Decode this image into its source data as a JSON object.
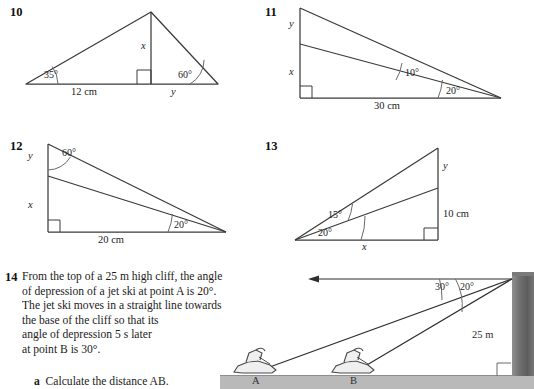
{
  "questions": [
    {
      "number": "10",
      "figure": {
        "base_label": "12 cm",
        "segment_label": "y",
        "height_label": "x",
        "angle_left": "35°",
        "angle_right": "60°",
        "right_angle": true
      }
    },
    {
      "number": "11",
      "figure": {
        "base_label": "30 cm",
        "upper_label": "y",
        "lower_label": "x",
        "angle_inner": "10°",
        "angle_outer": "20°",
        "right_angle": true
      }
    },
    {
      "number": "12",
      "figure": {
        "base_label": "20 cm",
        "upper_label": "y",
        "lower_label": "x",
        "angle_top": "60°",
        "angle_right": "20°",
        "right_angle": true
      }
    },
    {
      "number": "13",
      "figure": {
        "base_label": "x",
        "upper_label": "y",
        "lower_label": "10 cm",
        "angle_inner": "15°",
        "angle_outer": "20°",
        "right_angle": true
      }
    },
    {
      "number": "14",
      "body_lines": [
        "From the top of a 25 m high cliff, the angle",
        "of depression of a jet ski at point A is 20°.",
        "The jet ski moves in a straight line towards",
        "the base of the cliff so that its",
        "angle of depression 5 s later",
        "at point B is 30°."
      ],
      "parts": [
        {
          "letter": "a",
          "text": "Calculate the distance AB."
        }
      ],
      "figure": {
        "cliff_height_label": "25 m",
        "angle_outer": "30°",
        "angle_inner": "20°",
        "point_a_label": "A",
        "point_b_label": "B",
        "horizontal_arrow": true,
        "right_angle": true
      }
    }
  ],
  "colors": {
    "ink": "#1a1a1a",
    "line": "#3a3a3a",
    "ground": "#b9b9b9",
    "cliff": "#6f6f6f"
  }
}
